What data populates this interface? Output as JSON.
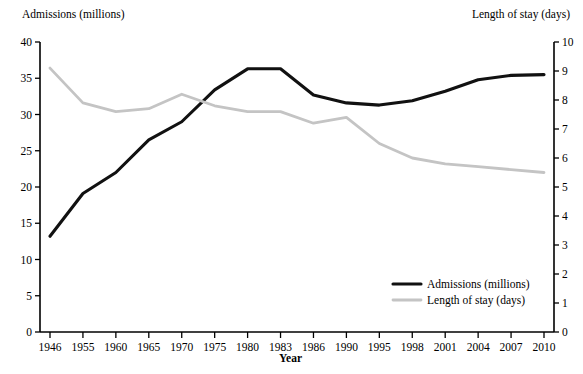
{
  "chart_data": {
    "type": "line",
    "title": "",
    "xlabel": "Year",
    "categories": [
      "1946",
      "1955",
      "1960",
      "1965",
      "1970",
      "1975",
      "1980",
      "1983",
      "1986",
      "1990",
      "1995",
      "1998",
      "2001",
      "2004",
      "2007",
      "2010"
    ],
    "grid": false,
    "legend_position": "inside-bottom-right",
    "axes": {
      "left": {
        "label": "Admissions (millions)",
        "min": 0,
        "max": 40,
        "step": 5,
        "ticks": [
          "0",
          "5",
          "10",
          "15",
          "20",
          "25",
          "30",
          "35",
          "40"
        ]
      },
      "right": {
        "label": "Length of stay (days)",
        "min": 0,
        "max": 10,
        "step": 1,
        "ticks": [
          "0",
          "1",
          "2",
          "3",
          "4",
          "5",
          "6",
          "7",
          "8",
          "9",
          "10"
        ]
      }
    },
    "series": [
      {
        "name": "Admissions (millions)",
        "axis": "left",
        "color": "#111111",
        "values": [
          13.2,
          19.1,
          22.0,
          26.5,
          29.0,
          33.4,
          36.3,
          36.3,
          32.7,
          31.6,
          31.3,
          31.9,
          33.2,
          34.8,
          35.4,
          35.5
        ]
      },
      {
        "name": "Length of stay (days)",
        "axis": "right",
        "color": "#c4c4c4",
        "values": [
          9.1,
          7.9,
          7.6,
          7.7,
          8.2,
          7.8,
          7.6,
          7.6,
          7.2,
          7.4,
          6.5,
          6.0,
          5.8,
          5.7,
          5.6,
          5.5
        ]
      }
    ],
    "legend": [
      {
        "label": "Admissions (millions)",
        "color": "#111111"
      },
      {
        "label": "Length of stay (days)",
        "color": "#c4c4c4"
      }
    ]
  }
}
